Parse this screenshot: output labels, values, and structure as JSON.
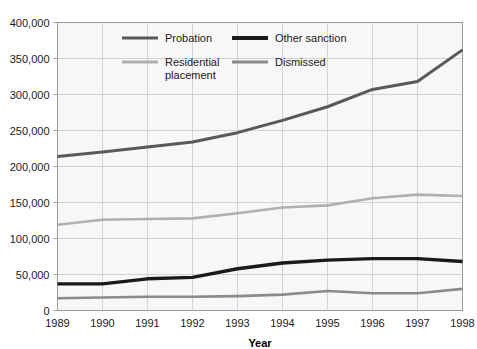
{
  "chart_data": {
    "type": "line",
    "title": "",
    "xlabel": "Year",
    "ylabel": "",
    "x": [
      1989,
      1990,
      1991,
      1992,
      1993,
      1994,
      1995,
      1996,
      1997,
      1998
    ],
    "categories": [
      "1989",
      "1990",
      "1991",
      "1992",
      "1993",
      "1994",
      "1995",
      "1996",
      "1997",
      "1998"
    ],
    "xlim": [
      1989,
      1998
    ],
    "ylim": [
      0,
      400000
    ],
    "ytick_labels": [
      "0",
      "50,000",
      "100,000",
      "150,000",
      "200,000",
      "250,000",
      "300,000",
      "350,000",
      "400,000"
    ],
    "ytick_values": [
      0,
      50000,
      100000,
      150000,
      200000,
      250000,
      300000,
      350000,
      400000
    ],
    "grid": true,
    "legend_position": "inside-top-left",
    "series": [
      {
        "name": "Probation",
        "color": "#595959",
        "values": [
          214000,
          220000,
          227000,
          234000,
          247000,
          264000,
          283000,
          307000,
          318000,
          362000
        ]
      },
      {
        "name": "Other sanction",
        "color": "#1a1a1a",
        "values": [
          37000,
          37000,
          44000,
          46000,
          58000,
          66000,
          70000,
          72000,
          72000,
          68000
        ]
      },
      {
        "name": "Residential placement",
        "color": "#b0b0b0",
        "values": [
          119000,
          126000,
          127000,
          128000,
          135000,
          143000,
          146000,
          156000,
          161000,
          159000
        ]
      },
      {
        "name": "Dismissed",
        "color": "#8a8a8a",
        "values": [
          17000,
          18000,
          19000,
          19000,
          20000,
          22000,
          27000,
          24000,
          24000,
          30000
        ]
      }
    ]
  },
  "legend": {
    "entries": [
      {
        "label": "Probation",
        "color": "#595959",
        "thickness": 3
      },
      {
        "label": "Other sanction",
        "color": "#1a1a1a",
        "thickness": 4
      },
      {
        "label": "Residential",
        "label2": "placement",
        "color": "#b0b0b0",
        "thickness": 3
      },
      {
        "label": "Dismissed",
        "color": "#8a8a8a",
        "thickness": 3
      }
    ]
  },
  "colors": {
    "plot_background": "#f7f7f7",
    "grid": "#c9c9c9",
    "frame": "#9a9a9a",
    "text": "#1a1a1a",
    "page_background": "#ffffff"
  }
}
